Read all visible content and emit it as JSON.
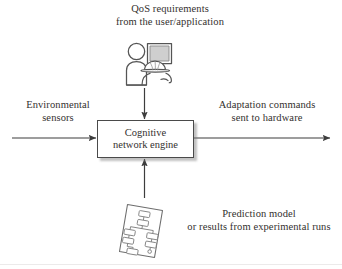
{
  "figure": {
    "type": "block-diagram",
    "background_color": "#ffffff",
    "line_color": "#4a4a4a",
    "text_color": "#33302e"
  },
  "labels": {
    "qos": {
      "line1": "QoS requirements",
      "line2": "from the user/application"
    },
    "environmental": {
      "line1": "Environmental",
      "line2": "sensors"
    },
    "adaptation": {
      "line1": "Adaptation commands",
      "line2": "sent to hardware"
    },
    "prediction": {
      "line1": "Prediction model",
      "line2": "or results from experimental runs"
    }
  },
  "engine": {
    "line1": "Cognitive",
    "line2": "network engine"
  },
  "icons": {
    "user_workstation": "user-at-computer-icon",
    "document": "results-document-icon"
  },
  "arrows": [
    {
      "name": "qos-to-engine",
      "from": "user-workstation-icon",
      "to": "engine-box",
      "direction": "down"
    },
    {
      "name": "sensors-to-engine",
      "from": "environmental-sensors",
      "to": "engine-box",
      "direction": "right"
    },
    {
      "name": "engine-to-hardware",
      "from": "engine-box",
      "to": "adaptation-commands",
      "direction": "right"
    },
    {
      "name": "prediction-to-engine",
      "from": "results-document-icon",
      "to": "engine-box",
      "direction": "up"
    }
  ]
}
